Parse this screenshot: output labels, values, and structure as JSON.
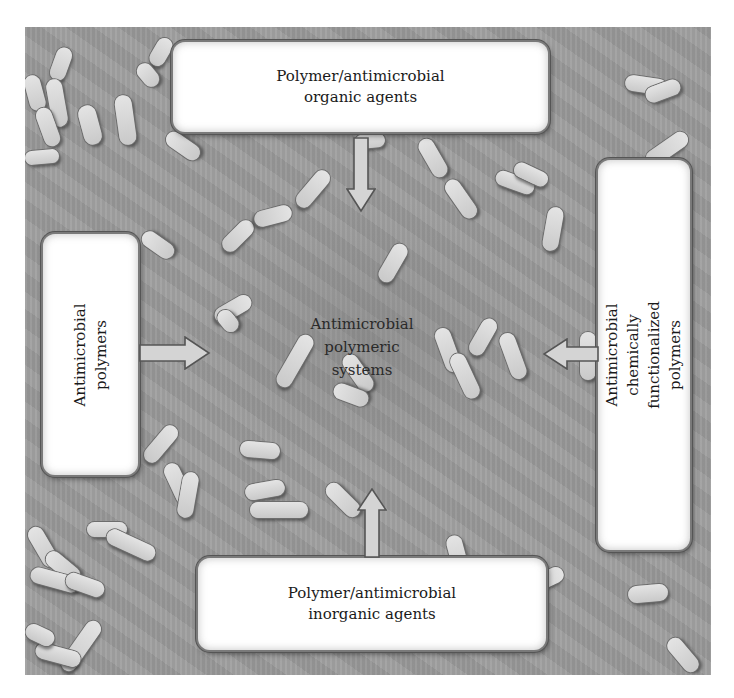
{
  "figure": {
    "title": "Antimicrobial polymeric systems",
    "center_label": "Antimicrobial\npolymeric\nsystems",
    "boxes": {
      "top": {
        "label": "Polymer/antimicrobial\norganic agents"
      },
      "left": {
        "label": "Antimicrobial\npolymers"
      },
      "right": {
        "label": "Antimicrobial chemically\nfunctionalized polymers"
      },
      "bottom": {
        "label": "Polymer/antimicrobial\ninorganic agents"
      }
    },
    "arrows": [
      {
        "from": "top",
        "direction": "down"
      },
      {
        "from": "left",
        "direction": "right"
      },
      {
        "from": "right",
        "direction": "left"
      },
      {
        "from": "bottom",
        "direction": "up"
      }
    ],
    "background": {
      "description": "micrograph of rod-shaped bacteria",
      "color": "#9c9c9c"
    },
    "colors": {
      "box_fill": "#ffffff",
      "arrow_fill": "#d4d4d4",
      "arrow_stroke": "#555555",
      "text": "#1a1a1a"
    }
  }
}
